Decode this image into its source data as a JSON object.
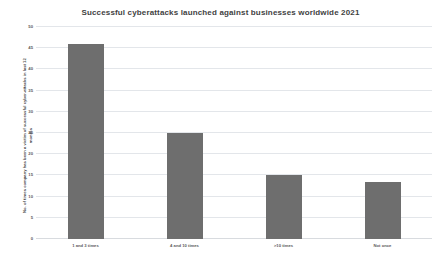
{
  "chart_data": {
    "type": "bar",
    "title": "Successful cyberattacks launched against businesses worldwide 2021",
    "xlabel": "",
    "ylabel": "No. of times company has been a victim of successful cyber-attacks in last 12 months",
    "categories": [
      "1 and 3 times",
      "4 and 10 times",
      ">10 times",
      "Not once"
    ],
    "values": [
      46,
      25,
      15,
      13.5
    ],
    "ylim": [
      0,
      50
    ],
    "ytick_values": [
      0,
      5,
      10,
      15,
      20,
      25,
      30,
      35,
      40,
      45,
      50
    ],
    "ytick_labels": [
      "0",
      "5",
      "10",
      "15",
      "20",
      "25",
      "30",
      "35",
      "40",
      "45",
      "50"
    ],
    "grid": true,
    "legend": false,
    "bar_color": "#6e6e6e",
    "grid_color": "#e3e6ea",
    "background_color": "#ffffff"
  }
}
